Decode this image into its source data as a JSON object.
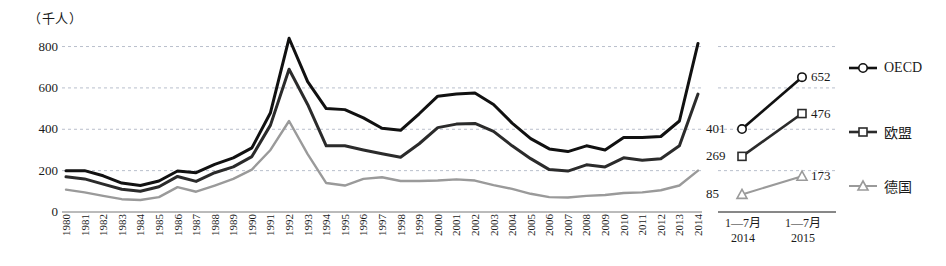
{
  "axis_unit_label": "（千人）",
  "legend": [
    {
      "name": "series-oecd",
      "label": "OECD",
      "marker": "circle",
      "color": "#111111"
    },
    {
      "name": "series-eu",
      "label": "欧盟",
      "marker": "square",
      "color": "#2b2b2b"
    },
    {
      "name": "series-germany",
      "label": "德国",
      "marker": "triangle",
      "color": "#9a9a9a"
    }
  ],
  "right_panel": {
    "x_labels": [
      {
        "line1": "1—7月",
        "line2": "2014"
      },
      {
        "line1": "1—7月",
        "line2": "2015"
      }
    ],
    "points": [
      {
        "series": "OECD",
        "value_2014": 401,
        "value_2015": 652,
        "label_2014": "401",
        "label_2015": "652"
      },
      {
        "series": "欧盟",
        "value_2014": 269,
        "value_2015": 476,
        "label_2014": "269",
        "label_2015": "476"
      },
      {
        "series": "德国",
        "value_2014": 85,
        "value_2015": 173,
        "label_2014": "85",
        "label_2015": "173"
      }
    ]
  },
  "chart_data": {
    "type": "line",
    "title": "",
    "xlabel": "",
    "ylabel": "（千人）",
    "ylim": [
      0,
      880
    ],
    "yticks": [
      0,
      200,
      400,
      600,
      800
    ],
    "grid": true,
    "legend_position": "right",
    "categories": [
      "1980",
      "1981",
      "1982",
      "1983",
      "1984",
      "1985",
      "1986",
      "1987",
      "1988",
      "1989",
      "1990",
      "1991",
      "1992",
      "1993",
      "1994",
      "1995",
      "1996",
      "1997",
      "1998",
      "1999",
      "2000",
      "2001",
      "2002",
      "2003",
      "2004",
      "2005",
      "2006",
      "2007",
      "2008",
      "2009",
      "2010",
      "2011",
      "2012",
      "2013",
      "2014"
    ],
    "series": [
      {
        "name": "OECD",
        "color": "#111111",
        "values": [
          200,
          200,
          175,
          140,
          128,
          150,
          198,
          190,
          230,
          262,
          310,
          480,
          840,
          630,
          500,
          495,
          455,
          405,
          395,
          475,
          560,
          570,
          575,
          520,
          430,
          355,
          305,
          292,
          320,
          300,
          360,
          360,
          365,
          440,
          815
        ]
      },
      {
        "name": "欧盟",
        "color": "#2b2b2b",
        "values": [
          170,
          160,
          135,
          110,
          100,
          122,
          172,
          148,
          190,
          218,
          268,
          420,
          690,
          520,
          320,
          320,
          300,
          282,
          265,
          330,
          408,
          425,
          428,
          390,
          320,
          258,
          205,
          198,
          228,
          218,
          262,
          250,
          258,
          320,
          570
        ]
      },
      {
        "name": "德国",
        "color": "#9a9a9a",
        "values": [
          108,
          95,
          78,
          62,
          58,
          72,
          120,
          98,
          128,
          160,
          205,
          300,
          440,
          280,
          140,
          128,
          160,
          168,
          150,
          150,
          152,
          158,
          152,
          130,
          112,
          88,
          72,
          70,
          78,
          82,
          92,
          95,
          105,
          128,
          200
        ]
      }
    ]
  }
}
